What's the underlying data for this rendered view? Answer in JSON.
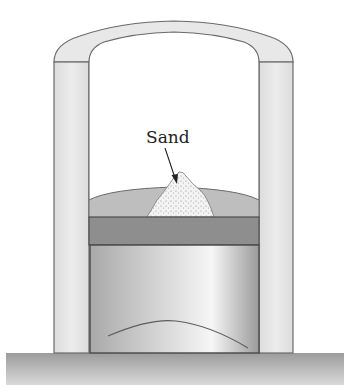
{
  "diagram": {
    "type": "piston-cylinder apparatus",
    "labels": {
      "sand": "Sand"
    },
    "parts": [
      {
        "id": "outer-housing",
        "description": "Arched outer housing with two side walls"
      },
      {
        "id": "gas-region",
        "description": "Dome-shaped region above piston holding sand"
      },
      {
        "id": "sand-pile",
        "description": "Stippled pile of sand on top"
      },
      {
        "id": "piston-plate",
        "description": "Dark horizontal piston plate"
      },
      {
        "id": "cylinder",
        "description": "Shaded cylinder beneath piston"
      },
      {
        "id": "floor",
        "description": "Ground / base slab"
      }
    ],
    "colors": {
      "housing_fill": "#e6e6e6",
      "housing_stroke": "#6a6a6a",
      "dome_fill": "#bdbdbd",
      "piston_fill": "#8f8f8f",
      "cylinder_light": "#f4f4f4",
      "cylinder_dark": "#a9a9a9",
      "floor_fill": "#a8a8a8",
      "sand_fill": "#f2f2f2",
      "sand_dots": "#8a8a8a",
      "arrow": "#222222"
    }
  }
}
